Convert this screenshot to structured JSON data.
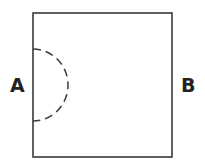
{
  "diagram": {
    "labels": {
      "left": "A",
      "right": "B"
    },
    "colors": {
      "stroke": "#3a3a3a",
      "text": "#222222",
      "background": "#ffffff"
    },
    "shapes": {
      "square": "solid-square",
      "arc": "dashed-semicircle"
    }
  }
}
